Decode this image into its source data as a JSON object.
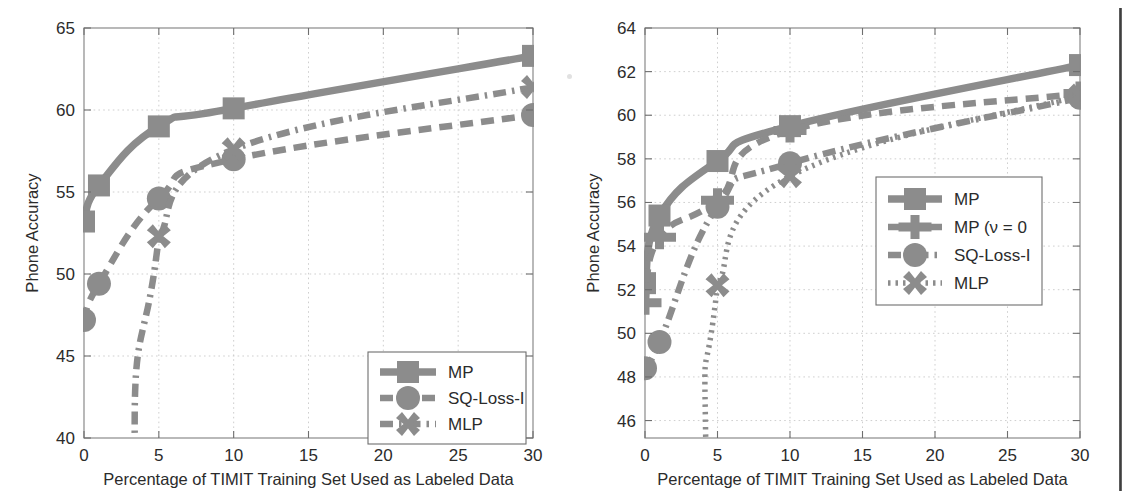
{
  "figure": {
    "panels": [
      "left",
      "right"
    ],
    "accent_gray": "#8c8c8c",
    "dark_gray": "#7a7a7a",
    "frame_color": "#8a8a8a",
    "grid_color": "#c9c9c9",
    "background": "#ffffff"
  },
  "chart_data": [
    {
      "id": "left",
      "type": "line",
      "title": "",
      "xlabel": "Percentage of TIMIT Training Set Used as Labeled Data",
      "ylabel": "Phone Accuracy",
      "xlim": [
        0,
        30
      ],
      "ylim": [
        40,
        65
      ],
      "xticks": [
        0,
        5,
        10,
        15,
        20,
        25,
        30
      ],
      "yticks": [
        40,
        45,
        50,
        55,
        60,
        65
      ],
      "xtick_labels": [
        "0",
        "5",
        "10",
        "15",
        "20",
        "25",
        "30"
      ],
      "ytick_labels": [
        "40",
        "45",
        "50",
        "55",
        "60",
        "65"
      ],
      "grid": true,
      "legend_position": "lower right",
      "x": [
        0,
        1,
        5,
        10,
        30
      ],
      "series": [
        {
          "name": "MP",
          "marker": "square",
          "linestyle": "solid",
          "color": "#8c8c8c",
          "values": [
            53.2,
            55.4,
            59.0,
            60.1,
            63.3
          ]
        },
        {
          "name": "SQ-Loss-I",
          "marker": "circle",
          "linestyle": "dashed",
          "color": "#8c8c8c",
          "values": [
            47.2,
            49.4,
            54.6,
            57.0,
            59.7
          ]
        },
        {
          "name": "MLP",
          "marker": "cross",
          "linestyle": "dashdot",
          "color": "#8c8c8c",
          "values": [
            null,
            null,
            52.3,
            57.6,
            61.4
          ],
          "extends_below_axis_at_x": 3.4
        }
      ]
    },
    {
      "id": "right",
      "type": "line",
      "title": "",
      "xlabel": "Percentage of TIMIT Training Set Used as Labeled Data",
      "ylabel": "Phone Accuracy",
      "xlim": [
        0,
        30
      ],
      "ylim": [
        45.2,
        64
      ],
      "xticks": [
        0,
        5,
        10,
        15,
        20,
        25,
        30
      ],
      "yticks": [
        46,
        48,
        50,
        52,
        54,
        56,
        58,
        60,
        62,
        64
      ],
      "xtick_labels": [
        "0",
        "5",
        "10",
        "15",
        "20",
        "25",
        "30"
      ],
      "ytick_labels": [
        "46",
        "48",
        "50",
        "52",
        "54",
        "56",
        "58",
        "60",
        "62",
        "64"
      ],
      "grid": true,
      "legend_position": "center right",
      "x": [
        0,
        1,
        5,
        10,
        30
      ],
      "series": [
        {
          "name": "MP",
          "marker": "square",
          "linestyle": "solid",
          "color": "#8c8c8c",
          "values": [
            52.3,
            55.4,
            57.9,
            59.5,
            62.3
          ]
        },
        {
          "name": "MP (ν = 0",
          "marker": "plus",
          "linestyle": "dashed",
          "color": "#8c8c8c",
          "values": [
            51.4,
            54.4,
            56.1,
            59.3,
            61.0
          ]
        },
        {
          "name": "SQ-Loss-I",
          "marker": "circle",
          "linestyle": "dashdot",
          "color": "#8c8c8c",
          "values": [
            48.4,
            49.6,
            55.8,
            57.8,
            60.8
          ]
        },
        {
          "name": "MLP",
          "marker": "cross",
          "linestyle": "dotted",
          "color": "#8c8c8c",
          "values": [
            null,
            null,
            52.2,
            57.2,
            60.9
          ],
          "extends_below_axis_at_x": 4.2
        }
      ]
    }
  ]
}
